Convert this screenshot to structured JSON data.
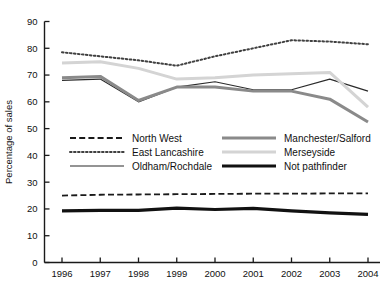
{
  "chart_data": {
    "type": "line",
    "title": "",
    "xlabel": "",
    "ylabel": "Percentage of sales",
    "categories": [
      "1996",
      "1997",
      "1998",
      "1999",
      "2000",
      "2001",
      "2002",
      "2003",
      "2004"
    ],
    "xlim": [
      1996,
      2004
    ],
    "ylim": [
      0,
      90
    ],
    "yticks": [
      0,
      10,
      20,
      30,
      40,
      50,
      60,
      70,
      80,
      90
    ],
    "ytick_labels": [
      "0",
      "10",
      "20",
      "30",
      "40",
      "50",
      "60",
      "70",
      "80",
      "90"
    ],
    "xticks": [
      "1996",
      "1997",
      "1998",
      "1999",
      "2000",
      "2001",
      "2002",
      "2003",
      "2004"
    ],
    "grid": false,
    "legend_position": "center-inside",
    "series": [
      {
        "name": "North West",
        "style": "dashed",
        "color": "#1a1a1a",
        "width": 1.8,
        "values": [
          25.0,
          25.3,
          25.4,
          25.5,
          25.6,
          25.7,
          25.7,
          25.8,
          25.8
        ]
      },
      {
        "name": "East Lancashire",
        "style": "dotted",
        "color": "#404040",
        "width": 2.0,
        "values": [
          78.5,
          77.0,
          75.5,
          73.5,
          77.0,
          80.0,
          83.0,
          82.5,
          81.5
        ]
      },
      {
        "name": "Oldham/Rochdale",
        "style": "solid-thin",
        "color": "#2b2b2b",
        "width": 1.2,
        "values": [
          68.0,
          68.5,
          60.0,
          65.5,
          67.5,
          64.5,
          64.5,
          68.5,
          64.0
        ]
      },
      {
        "name": "Manchester/Salford",
        "style": "solid-thick",
        "color": "#8a8a8a",
        "width": 3.0,
        "values": [
          69.0,
          69.5,
          60.5,
          65.5,
          65.5,
          64.0,
          64.0,
          61.0,
          52.5
        ]
      },
      {
        "name": "Merseyside",
        "style": "solid-thick",
        "color": "#d4d4d4",
        "width": 3.0,
        "values": [
          74.5,
          75.0,
          72.5,
          68.5,
          69.0,
          70.0,
          70.5,
          71.0,
          58.0
        ]
      },
      {
        "name": "Not pathfinder",
        "style": "solid-thick",
        "color": "#111111",
        "width": 3.2,
        "values": [
          19.3,
          19.5,
          19.5,
          20.3,
          19.8,
          20.2,
          19.3,
          18.5,
          18.0
        ]
      }
    ]
  },
  "legend": {
    "entries": [
      {
        "label": "North West",
        "key": "north-west"
      },
      {
        "label": "East Lancashire",
        "key": "east-lancashire"
      },
      {
        "label": "Oldham/Rochdale",
        "key": "oldham-rochdale"
      },
      {
        "label": "Manchester/Salford",
        "key": "manchester-salford"
      },
      {
        "label": "Merseyside",
        "key": "merseyside"
      },
      {
        "label": "Not pathfinder",
        "key": "not-pathfinder"
      }
    ]
  },
  "axes": {
    "y_title": "Percentage of sales",
    "y_tick_labels": [
      "90",
      "80",
      "70",
      "60",
      "50",
      "40",
      "30",
      "20",
      "10",
      "0"
    ],
    "x_tick_labels": [
      "1996",
      "1997",
      "1998",
      "1999",
      "2000",
      "2001",
      "2002",
      "2003",
      "2004"
    ]
  },
  "colors": {
    "axis": "#1a1a1a",
    "north_west": "#1a1a1a",
    "east_lancashire": "#404040",
    "oldham_rochdale": "#2b2b2b",
    "manchester_salford": "#8a8a8a",
    "merseyside": "#d4d4d4",
    "not_pathfinder": "#111111",
    "background": "#ffffff"
  }
}
